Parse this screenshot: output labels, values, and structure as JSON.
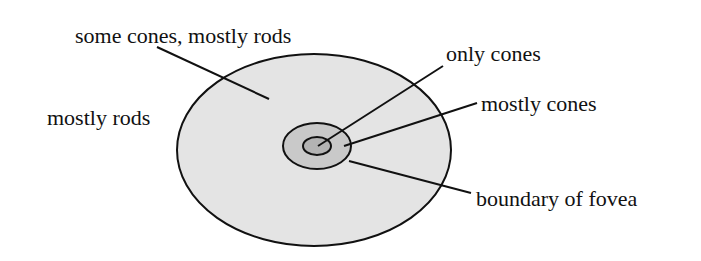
{
  "diagram": {
    "type": "retina-region-diagram",
    "colors": {
      "outer_fill": "#e4e4e4",
      "middle_fill": "#c9c9c9",
      "inner_fill": "#b3b3b3",
      "stroke": "#111111",
      "text": "#111111"
    },
    "regions": [
      {
        "id": "periphery",
        "shape": "ellipse",
        "cx": 314,
        "cy": 150,
        "rx": 137,
        "ry": 96
      },
      {
        "id": "fovea",
        "shape": "ellipse",
        "cx": 317,
        "cy": 146,
        "rx": 34,
        "ry": 23
      },
      {
        "id": "foveola",
        "shape": "ellipse",
        "cx": 317,
        "cy": 146,
        "rx": 14,
        "ry": 9
      }
    ],
    "labels": [
      {
        "id": "some-cones-mostly-rods",
        "text": "some cones, mostly rods",
        "x": 75,
        "y": 43,
        "leader": {
          "x1": 157,
          "y1": 47,
          "x2": 269,
          "y2": 99
        }
      },
      {
        "id": "mostly-rods",
        "text": "mostly rods",
        "x": 47,
        "y": 125,
        "leader": null
      },
      {
        "id": "only-cones",
        "text": "only cones",
        "x": 446,
        "y": 61,
        "leader": {
          "x1": 443,
          "y1": 66,
          "x2": 318,
          "y2": 146
        }
      },
      {
        "id": "mostly-cones",
        "text": "mostly cones",
        "x": 481,
        "y": 111,
        "leader": {
          "x1": 477,
          "y1": 103,
          "x2": 344,
          "y2": 146
        }
      },
      {
        "id": "boundary-of-fovea",
        "text": "boundary of fovea",
        "x": 476,
        "y": 206,
        "leader": {
          "x1": 471,
          "y1": 193,
          "x2": 349,
          "y2": 161
        }
      }
    ]
  }
}
